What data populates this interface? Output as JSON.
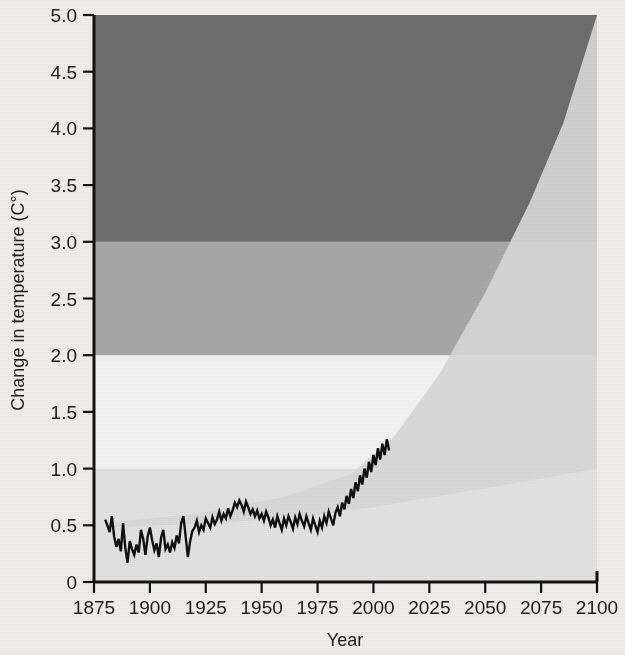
{
  "chart_data": {
    "type": "line",
    "title": "",
    "xlabel": "Year",
    "ylabel": "Change in temperature (C°)",
    "xlim": [
      1875,
      2100
    ],
    "ylim": [
      0,
      5.0
    ],
    "grid": false,
    "legend_position": "none",
    "x_ticks": [
      1875,
      1900,
      1925,
      1950,
      1975,
      2000,
      2025,
      2050,
      2075,
      2100
    ],
    "x_tick_labels": [
      "1875",
      "1900",
      "1925",
      "1950",
      "1975",
      "2000",
      "2025",
      "2050",
      "2075",
      "2100"
    ],
    "y_ticks": [
      0,
      0.5,
      1.0,
      1.5,
      2.0,
      2.5,
      3.0,
      3.5,
      4.0,
      4.5,
      5.0
    ],
    "y_tick_labels": [
      "0",
      "0.5",
      "1.0",
      "1.5",
      "2.0",
      "2.5",
      "3.0",
      "3.5",
      "4.0",
      "4.5",
      "5.0"
    ],
    "bands": [
      {
        "name": "low-risk-band",
        "from": 0.0,
        "to": 1.0,
        "color": "#e2e2e2"
      },
      {
        "name": "moderate-risk-band",
        "from": 1.0,
        "to": 2.0,
        "color": "#f3f3f3"
      },
      {
        "name": "high-risk-band",
        "from": 2.0,
        "to": 3.0,
        "color": "#a8a8a8"
      },
      {
        "name": "severe-risk-band",
        "from": 3.0,
        "to": 5.0,
        "color": "#6e6e6e"
      }
    ],
    "projection_cone": {
      "name": "projection-uncertainty-range",
      "color": "#d8d8d8",
      "start_year": 1880,
      "start_value": 0.5,
      "upper_end_year": 2100,
      "upper_end_value": 5.0,
      "lower_end_year": 2100,
      "lower_end_value": 1.0,
      "upper_bound": [
        [
          1880,
          0.52
        ],
        [
          1920,
          0.6
        ],
        [
          1960,
          0.75
        ],
        [
          1990,
          0.95
        ],
        [
          2010,
          1.3
        ],
        [
          2030,
          1.85
        ],
        [
          2050,
          2.55
        ],
        [
          2070,
          3.35
        ],
        [
          2085,
          4.05
        ],
        [
          2100,
          5.0
        ]
      ],
      "lower_bound": [
        [
          1880,
          0.48
        ],
        [
          1930,
          0.52
        ],
        [
          1970,
          0.58
        ],
        [
          2000,
          0.66
        ],
        [
          2030,
          0.76
        ],
        [
          2060,
          0.86
        ],
        [
          2100,
          1.0
        ]
      ]
    },
    "series": [
      {
        "name": "observed-global-temperature",
        "color": "#111111",
        "start_year": 1880,
        "end_year": 2007,
        "values": [
          0.55,
          0.5,
          0.44,
          0.58,
          0.4,
          0.31,
          0.38,
          0.27,
          0.52,
          0.3,
          0.17,
          0.36,
          0.29,
          0.24,
          0.33,
          0.26,
          0.46,
          0.38,
          0.24,
          0.4,
          0.48,
          0.37,
          0.28,
          0.34,
          0.22,
          0.39,
          0.46,
          0.29,
          0.33,
          0.26,
          0.35,
          0.3,
          0.41,
          0.34,
          0.52,
          0.58,
          0.4,
          0.22,
          0.36,
          0.45,
          0.48,
          0.54,
          0.44,
          0.5,
          0.46,
          0.56,
          0.52,
          0.48,
          0.57,
          0.51,
          0.55,
          0.62,
          0.54,
          0.6,
          0.56,
          0.65,
          0.58,
          0.63,
          0.7,
          0.66,
          0.72,
          0.68,
          0.62,
          0.71,
          0.66,
          0.6,
          0.64,
          0.58,
          0.63,
          0.56,
          0.6,
          0.54,
          0.62,
          0.57,
          0.5,
          0.55,
          0.48,
          0.58,
          0.52,
          0.46,
          0.56,
          0.5,
          0.58,
          0.53,
          0.47,
          0.57,
          0.51,
          0.6,
          0.54,
          0.49,
          0.58,
          0.52,
          0.46,
          0.56,
          0.5,
          0.44,
          0.54,
          0.48,
          0.58,
          0.52,
          0.62,
          0.56,
          0.5,
          0.61,
          0.66,
          0.58,
          0.7,
          0.64,
          0.76,
          0.69,
          0.82,
          0.74,
          0.88,
          0.8,
          0.94,
          0.86,
          1.0,
          0.92,
          1.06,
          0.97,
          1.12,
          1.03,
          1.18,
          1.08,
          1.22,
          1.12,
          1.26,
          1.16
        ]
      }
    ]
  },
  "axes": {
    "x_axis_name": "year-axis",
    "y_axis_name": "temperature-axis"
  }
}
